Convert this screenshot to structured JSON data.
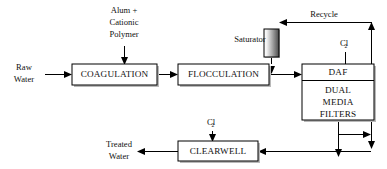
{
  "diagram": {
    "type": "process-flow",
    "canvas": {
      "width": 387,
      "height": 169
    },
    "colors": {
      "line": "#000000",
      "box_fill": "#ffffff",
      "box_stroke": "#000000",
      "box_shadow": "#b9b9b9",
      "text": "#111111",
      "saturator_gradient_start": "#ffffff",
      "saturator_gradient_end": "#4a4a4a"
    },
    "process_boxes": [
      {
        "id": "coagulation",
        "label": "COAGULATION",
        "x": 72,
        "y": 64,
        "width": 85,
        "height": 21
      },
      {
        "id": "flocculation",
        "label": "FLOCCULATION",
        "x": 178,
        "y": 64,
        "width": 91,
        "height": 21
      },
      {
        "id": "clearwell",
        "label": "CLEARWELL",
        "x": 178,
        "y": 141,
        "width": 80,
        "height": 20
      }
    ],
    "daf_unit": {
      "id": "daf-filters",
      "x": 302,
      "y": 64,
      "width": 72,
      "height": 56,
      "top_label": "DAF",
      "body_lines": [
        "DUAL",
        "MEDIA",
        "FILTERS"
      ],
      "divider_y": 80
    },
    "saturator": {
      "id": "saturator",
      "label": "Saturator",
      "label_x": 250,
      "label_y": 39,
      "x": 264,
      "y": 29,
      "width": 15,
      "height": 28
    },
    "free_labels": [
      {
        "id": "chemical-feed-1",
        "lines": [
          "Alum +",
          "Cationic",
          "Polymer"
        ],
        "x": 124,
        "y": 11,
        "line_height": 12
      },
      {
        "id": "raw-water",
        "lines": [
          "Raw",
          "Water"
        ],
        "x": 24,
        "y": 68,
        "line_height": 12
      },
      {
        "id": "treated-water",
        "lines": [
          "Treated",
          "Water"
        ],
        "x": 119,
        "y": 145,
        "line_height": 12
      },
      {
        "id": "recycle",
        "lines": [
          "Recycle"
        ],
        "x": 324,
        "y": 15,
        "line_height": 12
      }
    ],
    "chlorine_labels": [
      {
        "id": "chlorine-daf",
        "text": "Cl",
        "subscript": "2",
        "x": 345,
        "y": 44
      },
      {
        "id": "chlorine-clearwell",
        "text": "Cl",
        "subscript": "2",
        "x": 212,
        "y": 123
      }
    ],
    "flows": [
      {
        "id": "raw-water-to-coagulation",
        "from": "raw-water",
        "to": "coagulation"
      },
      {
        "id": "chemical-to-coagulation",
        "from": "chemical-feed-1",
        "to": "coagulation"
      },
      {
        "id": "coagulation-to-flocculation",
        "from": "coagulation",
        "to": "flocculation"
      },
      {
        "id": "flocculation-to-daf",
        "from": "flocculation",
        "to": "daf-filters"
      },
      {
        "id": "saturator-to-inlet",
        "from": "saturator",
        "to": "flocculation-outlet"
      },
      {
        "id": "chlorine-to-daf",
        "from": "chlorine-daf",
        "to": "daf-filters"
      },
      {
        "id": "daf-to-clearwell",
        "from": "daf-filters",
        "to": "clearwell"
      },
      {
        "id": "daf-to-recycle",
        "from": "daf-filters",
        "to": "recycle-riser"
      },
      {
        "id": "recycle-to-saturator",
        "from": "recycle-riser",
        "to": "saturator"
      },
      {
        "id": "chlorine-to-clearwell",
        "from": "chlorine-clearwell",
        "to": "clearwell"
      },
      {
        "id": "clearwell-to-treated-water",
        "from": "clearwell",
        "to": "treated-water"
      }
    ]
  }
}
